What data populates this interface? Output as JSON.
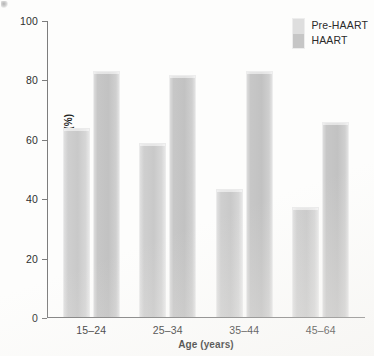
{
  "chart_data": {
    "type": "bar",
    "title": "",
    "subtitle": "",
    "xlabel": "Age (years)",
    "ylabel": "10-Year Survival Rates (%)",
    "categories": [
      "15–24",
      "25–34",
      "35–44",
      "45–64"
    ],
    "series": [
      {
        "name": "Pre-HAART",
        "values": [
          63.5,
          58.5,
          43,
          37
        ],
        "color": "#cfcfcf"
      },
      {
        "name": "HAART",
        "values": [
          83,
          81.5,
          83,
          65.5
        ],
        "color": "#c4c4c4"
      }
    ],
    "ylim": [
      0,
      100
    ],
    "ytick_labels": [
      "100",
      "80",
      "60",
      "40",
      "20",
      "0"
    ],
    "ytick_values": [
      100,
      80,
      60,
      40,
      20,
      0
    ],
    "grid": false,
    "legend_position": "top-right",
    "annotations": []
  },
  "legend": {
    "entries": [
      {
        "label": "Pre-HAART"
      },
      {
        "label": "HAART"
      }
    ]
  }
}
